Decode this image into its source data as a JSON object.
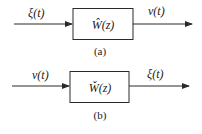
{
  "diagrams": [
    {
      "caption": "(a)",
      "input_signal": "ξ(t)",
      "output_signal": "ν(t)",
      "block_label": "Ŵ(z)"
    },
    {
      "caption": "(b)",
      "input_signal": "ν(t)",
      "output_signal": "ξ(t)",
      "block_label": "W̌(z)"
    }
  ],
  "colors": {
    "stroke": "#2a2a2a",
    "background": "#ffffff"
  }
}
